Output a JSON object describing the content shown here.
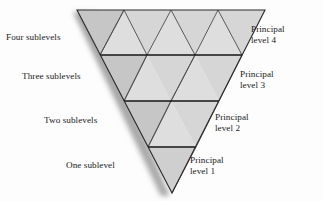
{
  "figure": {
    "background_color": "#fdfdfd",
    "text_color": "#1b1b1b"
  },
  "diagram": {
    "shape": "inverted-triangle",
    "apex_bottom": {
      "x": 172,
      "y": 193
    },
    "top_left": {
      "x": 77,
      "y": 10
    },
    "top_right": {
      "x": 265,
      "y": 10
    },
    "levels": 4,
    "outline_color": "#2a2a2a",
    "divider_color": "#1a1a1a",
    "fill_light": "#dcdcdc",
    "fill_mid": "#d4d4d4",
    "fill_dark": "#c6c6c6",
    "shadow_color": "#b9b9b9",
    "dividers": [
      {
        "level": 4,
        "y": 55,
        "x_start": 100,
        "x_end": 242
      },
      {
        "level": 3,
        "y": 101,
        "x_start": 124,
        "x_end": 219
      },
      {
        "level": 2,
        "y": 147,
        "x_start": 148,
        "x_end": 196
      }
    ]
  },
  "labels": {
    "sublevels": [
      {
        "id": "four",
        "text": "Four sublevels",
        "level": 4,
        "sublevel_count": 4
      },
      {
        "id": "three",
        "text": "Three sublevels",
        "level": 3,
        "sublevel_count": 3
      },
      {
        "id": "two",
        "text": "Two sublevels",
        "level": 2,
        "sublevel_count": 2
      },
      {
        "id": "one",
        "text": "One sublevel",
        "level": 1,
        "sublevel_count": 1
      }
    ],
    "principal": [
      {
        "id": "p4",
        "line1": "Principal",
        "line2": "level 4",
        "level": 4
      },
      {
        "id": "p3",
        "line1": "Principal",
        "line2": "level 3",
        "level": 3
      },
      {
        "id": "p2",
        "line1": "Principal",
        "line2": "level 2",
        "level": 2
      },
      {
        "id": "p1",
        "line1": "Principal",
        "line2": "level 1",
        "level": 1
      }
    ]
  }
}
